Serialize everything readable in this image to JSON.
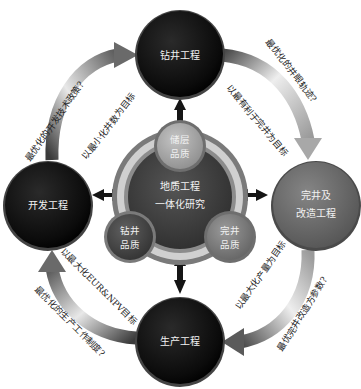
{
  "diagram": {
    "center": {
      "title_line1": "地质工程",
      "title_line2": "一体化研究",
      "qualities": [
        {
          "id": "reservoir",
          "line1": "储层",
          "line2": "品质",
          "color": "#a9a9a9"
        },
        {
          "id": "drilling",
          "line1": "钻井",
          "line2": "品质",
          "color": "#4a4a4a"
        },
        {
          "id": "completion",
          "line1": "完井",
          "line2": "品质",
          "color": "#7d7d7d"
        }
      ]
    },
    "nodes": [
      {
        "id": "drilling",
        "line1": "钻井工程",
        "line2": "",
        "color": "#111111"
      },
      {
        "id": "completion",
        "line1": "完井及",
        "line2": "改造工程",
        "color": "#6b6b6b"
      },
      {
        "id": "production",
        "line1": "生产工程",
        "line2": "",
        "color": "#0e0e0e"
      },
      {
        "id": "development",
        "line1": "开发工程",
        "line2": "",
        "color": "#121212"
      }
    ],
    "arrows": [
      {
        "from": "development",
        "to": "drilling",
        "question": "最优化的开发技术政策?",
        "goal": "以最小化井数为目标"
      },
      {
        "from": "drilling",
        "to": "completion",
        "question": "最优化的井眼轨迹?",
        "goal": "以最有利于完井为目标"
      },
      {
        "from": "completion",
        "to": "production",
        "question": "最优完井改造方参数?",
        "goal": "以最大化产量为目标"
      },
      {
        "from": "production",
        "to": "development",
        "question": "最优化的生产工作制度?",
        "goal": "以最大化EUR&NPV目标"
      }
    ],
    "colors": {
      "dark_node": "#111111",
      "gray_node": "#6b6b6b",
      "ring_outer": "#8a8a8a",
      "ring_light": "#c9c9c9",
      "core": "#3e3e3e",
      "arrow_dark": "#4a4a4a",
      "arrow_light": "#e6e6e6"
    }
  }
}
